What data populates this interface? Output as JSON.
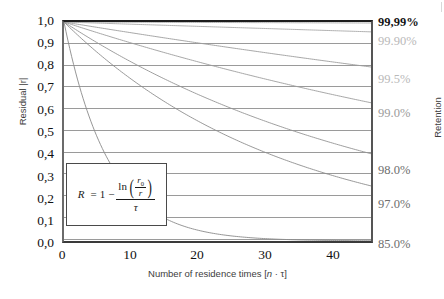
{
  "chart_data": {
    "type": "line",
    "title": "",
    "xlabel": "Number of residence times [n · τ]",
    "ylabel": "Residual |r|",
    "y2label": "Retention",
    "xlim": [
      0,
      46
    ],
    "ylim": [
      0.0,
      1.0
    ],
    "grid": true,
    "legend_position": "right-axis",
    "x_ticks": [
      "0",
      "10",
      "20",
      "30",
      "40"
    ],
    "x_tick_values": [
      0,
      10,
      20,
      30,
      40
    ],
    "y_ticks": [
      "0,0",
      "0,1",
      "0,2",
      "0,3",
      "0,4",
      "0,5",
      "0,6",
      "0,7",
      "0,8",
      "0,9",
      "1,0"
    ],
    "y_tick_values": [
      0.0,
      0.1,
      0.2,
      0.3,
      0.4,
      0.5,
      0.6,
      0.7,
      0.8,
      0.9,
      1.0
    ],
    "y2_ticks": [
      "99,99%",
      "99.90%",
      "99.5%",
      "99.0%",
      "98.0%",
      "97.0%",
      "85.0%"
    ],
    "y2_tick_retentions": [
      0.9999,
      0.999,
      0.995,
      0.99,
      0.98,
      0.97,
      0.85
    ],
    "annotation": "R = 1 - ln(r0/r)/τ",
    "series": [
      {
        "name": "99,99%",
        "retention": 0.9999,
        "label": "99,99%",
        "color": "#a8a8a8",
        "x": [
          0,
          5,
          10,
          15,
          20,
          25,
          30,
          35,
          40,
          46
        ],
        "y": [
          1.0,
          0.9995,
          0.999,
          0.9985,
          0.998,
          0.9975,
          0.997,
          0.9965,
          0.996,
          0.9954
        ]
      },
      {
        "name": "99.90%",
        "retention": 0.999,
        "label": "99.90%",
        "color": "#a8a8a8",
        "x": [
          0,
          5,
          10,
          15,
          20,
          25,
          30,
          35,
          40,
          46
        ],
        "y": [
          1.0,
          0.995,
          0.99,
          0.985,
          0.98,
          0.975,
          0.97,
          0.966,
          0.961,
          0.955
        ]
      },
      {
        "name": "99.5%",
        "retention": 0.995,
        "label": "99.5%",
        "color": "#9d9d9d",
        "x": [
          0,
          5,
          10,
          15,
          20,
          25,
          30,
          35,
          40,
          46
        ],
        "y": [
          1.0,
          0.975,
          0.951,
          0.928,
          0.905,
          0.882,
          0.861,
          0.839,
          0.819,
          0.794
        ]
      },
      {
        "name": "99.0%",
        "retention": 0.99,
        "label": "99.0%",
        "color": "#9d9d9d",
        "x": [
          0,
          5,
          10,
          15,
          20,
          25,
          30,
          35,
          40,
          46
        ],
        "y": [
          1.0,
          0.951,
          0.905,
          0.861,
          0.819,
          0.779,
          0.741,
          0.705,
          0.67,
          0.631
        ]
      },
      {
        "name": "98.0%",
        "retention": 0.98,
        "label": "98.0%",
        "color": "#949494",
        "x": [
          0,
          5,
          10,
          15,
          20,
          25,
          30,
          35,
          40,
          46
        ],
        "y": [
          1.0,
          0.905,
          0.819,
          0.741,
          0.67,
          0.607,
          0.549,
          0.497,
          0.449,
          0.398
        ]
      },
      {
        "name": "97.0%",
        "retention": 0.97,
        "label": "97.0%",
        "color": "#8d8d8d",
        "x": [
          0,
          5,
          10,
          15,
          20,
          25,
          30,
          35,
          40,
          46
        ],
        "y": [
          1.0,
          0.861,
          0.741,
          0.638,
          0.549,
          0.472,
          0.407,
          0.35,
          0.301,
          0.251
        ]
      },
      {
        "name": "85.0%",
        "retention": 0.85,
        "label": "85.0%",
        "color": "#8a8a8a",
        "x": [
          0,
          2,
          4,
          6,
          8,
          10,
          14,
          18,
          22,
          28,
          34,
          40,
          46
        ],
        "y": [
          1.0,
          0.741,
          0.549,
          0.407,
          0.301,
          0.223,
          0.122,
          0.067,
          0.037,
          0.015,
          0.006,
          0.0025,
          0.001
        ]
      }
    ]
  },
  "axes": {
    "y_title": "Residual |r|",
    "x_title_prefix": "Number of residence times [",
    "x_title_italic": "n",
    "x_title_mid": " · ",
    "x_title_tau": "τ",
    "x_title_suffix": "]",
    "y2_title": "Retention"
  },
  "formula": {
    "lhs": "R",
    "equals": "=",
    "one": "1",
    "minus": "−",
    "ln": "ln",
    "numerator_var": "r",
    "numerator_sub": "0",
    "denominator_var": "r",
    "fraction_denominator": "τ"
  }
}
